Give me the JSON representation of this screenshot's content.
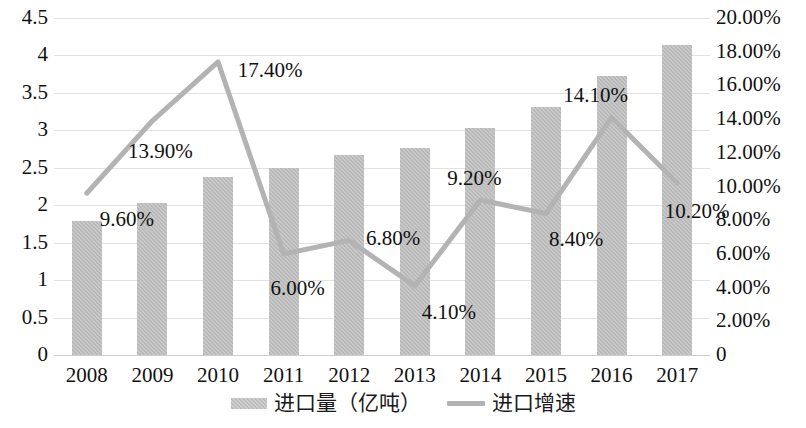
{
  "chart_data": {
    "type": "bar",
    "title": "",
    "xlabel": "",
    "ylabel": "",
    "grid": true,
    "legend_position": "bottom",
    "categories": [
      "2008",
      "2009",
      "2010",
      "2011",
      "2012",
      "2013",
      "2014",
      "2015",
      "2016",
      "2017"
    ],
    "axes": {
      "left": {
        "ticks": [
          "0",
          "0.5",
          "1",
          "1.5",
          "2",
          "2.5",
          "3",
          "3.5",
          "4",
          "4.5"
        ],
        "min": 0,
        "max": 4.5,
        "step": 0.5
      },
      "right": {
        "ticks": [
          "0",
          "2.00%",
          "4.00%",
          "6.00%",
          "8.00%",
          "10.00%",
          "12.00%",
          "14.00%",
          "16.00%",
          "18.00%",
          "20.00%"
        ],
        "min": 0,
        "max": 20,
        "step": 2,
        "unit": "%"
      }
    },
    "series": [
      {
        "name": "进口量（亿吨）",
        "type": "bar",
        "axis": "left",
        "color": "#b9b9b9",
        "values": [
          1.79,
          2.03,
          2.38,
          2.5,
          2.67,
          2.76,
          3.03,
          3.31,
          3.73,
          4.14
        ]
      },
      {
        "name": "进口增速",
        "type": "line",
        "axis": "right",
        "color": "#b3b3b3",
        "values": [
          9.6,
          13.9,
          17.4,
          6.0,
          6.8,
          4.1,
          9.2,
          8.4,
          14.1,
          10.2
        ],
        "data_labels": [
          "9.60%",
          "13.90%",
          "17.40%",
          "6.00%",
          "6.80%",
          "4.10%",
          "9.20%",
          "8.40%",
          "14.10%",
          "10.20%"
        ]
      }
    ]
  },
  "legend": {
    "items": [
      {
        "label": "进口量（亿吨）",
        "marker": "bar-swatch"
      },
      {
        "label": "进口增速",
        "marker": "line-swatch"
      }
    ]
  }
}
